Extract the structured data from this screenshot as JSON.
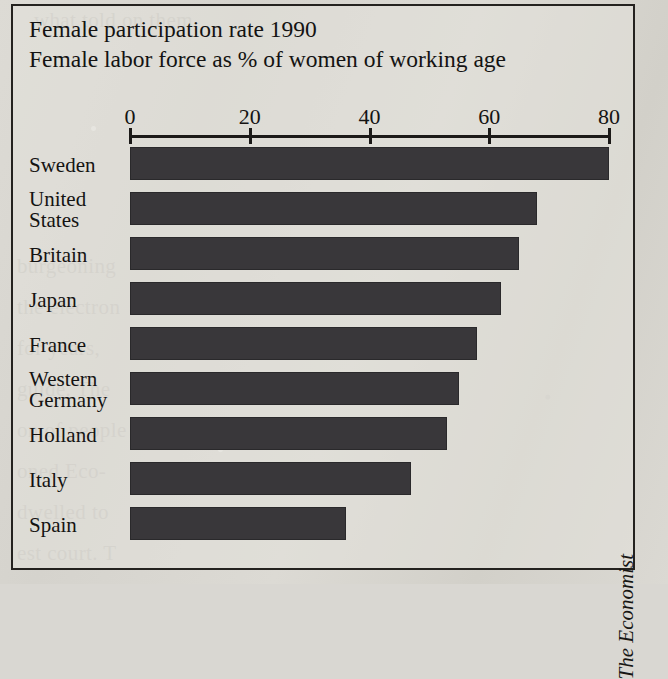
{
  "chart_data": {
    "type": "bar",
    "orientation": "horizontal",
    "title": "Female participation rate 1990",
    "subtitle": "Female labor force as % of women of working age",
    "xlabel": "",
    "ylabel": "",
    "xlim": [
      0,
      80
    ],
    "xticks": [
      0,
      20,
      40,
      60,
      80
    ],
    "xtick_labels": [
      "0",
      "20",
      "40",
      "60",
      "80"
    ],
    "grid": false,
    "legend": false,
    "bar_color": "#39373a",
    "categories": [
      "Sweden",
      "United States",
      "Britain",
      "Japan",
      "France",
      "Western Germany",
      "Holland",
      "Italy",
      "Spain"
    ],
    "values": [
      80,
      68,
      65,
      62,
      58,
      55,
      53,
      47,
      36
    ],
    "source": "The Economist"
  },
  "frame": {
    "border_color": "#24221f"
  },
  "rows": [
    {
      "label": "Sweden",
      "label_line1": "Sweden",
      "label_line2": "",
      "value": 80
    },
    {
      "label": "United States",
      "label_line1": "United",
      "label_line2": "States",
      "value": 68
    },
    {
      "label": "Britain",
      "label_line1": "Britain",
      "label_line2": "",
      "value": 65
    },
    {
      "label": "Japan",
      "label_line1": "Japan",
      "label_line2": "",
      "value": 62
    },
    {
      "label": "France",
      "label_line1": "France",
      "label_line2": "",
      "value": 58
    },
    {
      "label": "Western Germany",
      "label_line1": "Western",
      "label_line2": "Germany",
      "value": 55
    },
    {
      "label": "Holland",
      "label_line1": "Holland",
      "label_line2": "",
      "value": 53
    },
    {
      "label": "Italy",
      "label_line1": "Italy",
      "label_line2": "",
      "value": 47
    },
    {
      "label": "Spain",
      "label_line1": "Spain",
      "label_line2": "",
      "value": 36
    }
  ],
  "credit": {
    "text": "The Economist"
  },
  "background_text": {
    "lines": "      what told on them,\n\n\n\n\n\n   burgeoning\n   the electron\n   for years,\n   guide. The\n   on of people\n   oned Eco-\n   dwelled to\n   est court. T"
  }
}
